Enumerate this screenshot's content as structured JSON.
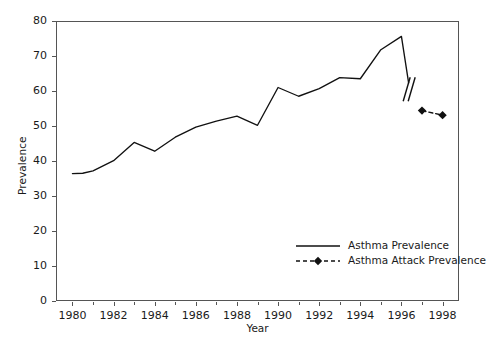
{
  "chart_data": {
    "type": "line",
    "title": "",
    "xlabel": "Year",
    "ylabel": "Prevalence",
    "xlim": [
      1979.2,
      1998.8
    ],
    "ylim": [
      0,
      80
    ],
    "grid": false,
    "legend_position": "inside-bottom-right",
    "x_ticks": [
      1980,
      1982,
      1984,
      1986,
      1988,
      1990,
      1992,
      1994,
      1996,
      1998
    ],
    "x_tick_labels": [
      "1980",
      "1982",
      "1984",
      "1986",
      "1988",
      "1990",
      "1992",
      "1994",
      "1996",
      "1998"
    ],
    "x_minor_ticks": [
      1981,
      1983,
      1985,
      1987,
      1989,
      1991,
      1993,
      1995,
      1997
    ],
    "y_ticks": [
      0,
      10,
      20,
      30,
      40,
      50,
      60,
      70,
      80
    ],
    "y_tick_labels": [
      "0",
      "10",
      "20",
      "30",
      "40",
      "50",
      "60",
      "70",
      "80"
    ],
    "annotations": [
      {
        "name": "axis-break-marks",
        "type": "double-slash",
        "x": 1996.45,
        "y": 60.5,
        "note": "Double slash break indicating discontinuity between the two series"
      }
    ],
    "series": [
      {
        "name": "Asthma Prevalence",
        "style": "solid",
        "marker": "none",
        "color": "#111111",
        "x": [
          1980,
          1980.5,
          1981,
          1982,
          1983,
          1984,
          1985,
          1986,
          1987,
          1988,
          1989,
          1990,
          1991,
          1992,
          1993,
          1994,
          1995,
          1996,
          1996.35
        ],
        "values": [
          36.4,
          36.5,
          37.2,
          40.1,
          45.3,
          42.8,
          46.8,
          49.7,
          51.4,
          52.8,
          50.2,
          61.0,
          58.5,
          60.7,
          63.8,
          63.5,
          71.8,
          75.6,
          62.3
        ]
      },
      {
        "name": "Asthma Attack Prevalence",
        "style": "dashed",
        "marker": "diamond",
        "color": "#111111",
        "x": [
          1997,
          1998
        ],
        "values": [
          54.4,
          53.1
        ]
      }
    ]
  },
  "legend": {
    "entries": [
      {
        "label": "Asthma Prevalence",
        "key": "solid-line-key"
      },
      {
        "label": "Asthma Attack Prevalence",
        "key": "dashed-diamond-key"
      }
    ]
  },
  "colors": {
    "line": "#111111",
    "axis": "#555555",
    "text": "#1a1a1a",
    "background": "#ffffff"
  }
}
